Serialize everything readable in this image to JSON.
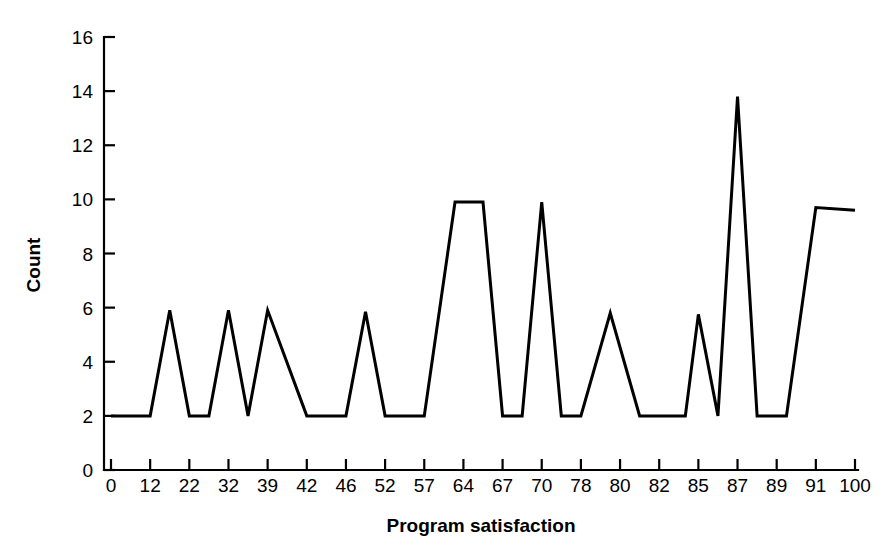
{
  "chart_data": {
    "type": "line",
    "title": "",
    "xlabel": "Program satisfaction",
    "ylabel": "Count",
    "categories": [
      "0",
      "12",
      "22",
      "32",
      "39",
      "42",
      "46",
      "52",
      "57",
      "64",
      "67",
      "70",
      "78",
      "80",
      "82",
      "85",
      "87",
      "89",
      "91",
      "100"
    ],
    "values": [
      2,
      2,
      2,
      2,
      2,
      2,
      2,
      2,
      2,
      9.9,
      2,
      2,
      2,
      2,
      2,
      2,
      13.8,
      2,
      9.7,
      9.6
    ],
    "vertices": [
      {
        "x": 0,
        "y": 2
      },
      {
        "x": 12,
        "y": 2
      },
      {
        "x": 17,
        "y": 5.9
      },
      {
        "x": 22,
        "y": 2
      },
      {
        "x": 27,
        "y": 2
      },
      {
        "x": 32,
        "y": 5.9
      },
      {
        "x": 35.5,
        "y": 2
      },
      {
        "x": 39,
        "y": 5.9
      },
      {
        "x": 42,
        "y": 2
      },
      {
        "x": 46,
        "y": 2
      },
      {
        "x": 49,
        "y": 5.85
      },
      {
        "x": 52,
        "y": 2
      },
      {
        "x": 57,
        "y": 2
      },
      {
        "x": 62.5,
        "y": 9.9
      },
      {
        "x": 65.5,
        "y": 9.9
      },
      {
        "x": 67,
        "y": 2
      },
      {
        "x": 68.5,
        "y": 2
      },
      {
        "x": 70,
        "y": 9.9
      },
      {
        "x": 74,
        "y": 2
      },
      {
        "x": 78,
        "y": 2
      },
      {
        "x": 79.5,
        "y": 5.8
      },
      {
        "x": 81,
        "y": 2
      },
      {
        "x": 84,
        "y": 2
      },
      {
        "x": 85,
        "y": 5.75
      },
      {
        "x": 86,
        "y": 2
      },
      {
        "x": 87,
        "y": 13.8
      },
      {
        "x": 88,
        "y": 2
      },
      {
        "x": 89.5,
        "y": 2
      },
      {
        "x": 91,
        "y": 9.7
      },
      {
        "x": 100,
        "y": 9.6
      }
    ],
    "ylim": [
      0,
      16
    ],
    "yticks": [
      0,
      2,
      4,
      6,
      8,
      10,
      12,
      14,
      16
    ],
    "xtick_labels": [
      "0",
      "12",
      "22",
      "32",
      "39",
      "42",
      "46",
      "52",
      "57",
      "64",
      "67",
      "70",
      "78",
      "80",
      "82",
      "85",
      "87",
      "89",
      "91",
      "100"
    ],
    "grid": false,
    "legend": "none",
    "line_color": "#000000",
    "background_color": "#ffffff"
  }
}
